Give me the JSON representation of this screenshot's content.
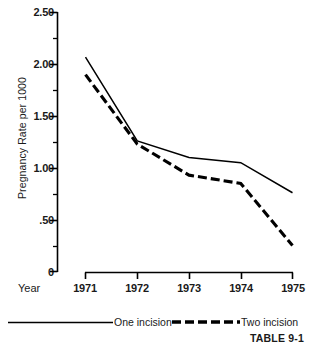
{
  "chart_data": {
    "type": "line",
    "title": "",
    "xlabel": "Year",
    "ylabel": "Pregnancy Rate per 1000",
    "x": [
      1971,
      1972,
      1973,
      1974,
      1975
    ],
    "categories": [
      "1971",
      "1972",
      "1973",
      "1974",
      "1975"
    ],
    "xtick_labels": [
      "1971",
      "1972",
      "1973",
      "1974",
      "1975"
    ],
    "ytick_labels": [
      "2.50",
      "2.00",
      "1.50",
      "1.00",
      ".50",
      "0"
    ],
    "ytick_values": [
      2.5,
      2.0,
      1.5,
      1.0,
      0.5,
      0
    ],
    "yminor_values": [
      2.25,
      1.75,
      1.25,
      0.75,
      0.25
    ],
    "ylim": [
      0,
      2.5
    ],
    "xlim": [
      1971,
      1975
    ],
    "grid": false,
    "legend_position": "bottom",
    "series": [
      {
        "name": "One incision",
        "style": "solid",
        "color": "#000000",
        "values": [
          2.07,
          1.26,
          1.1,
          1.05,
          0.76
        ]
      },
      {
        "name": "Two incision",
        "style": "dashed",
        "color": "#000000",
        "values": [
          1.9,
          1.23,
          0.93,
          0.85,
          0.25
        ]
      }
    ],
    "annotations": [
      "TABLE 9-1"
    ]
  },
  "axes": {
    "y_axis_title": "Pregnancy Rate per 1000",
    "x_axis_title": "Year",
    "y_ticks": [
      {
        "label": "2.50",
        "value": 2.5
      },
      {
        "label": "2.00",
        "value": 2.0
      },
      {
        "label": "1.50",
        "value": 1.5
      },
      {
        "label": "1.00",
        "value": 1.0
      },
      {
        "label": ".50",
        "value": 0.5
      },
      {
        "label": "0",
        "value": 0
      }
    ],
    "x_ticks": [
      {
        "label": "1971"
      },
      {
        "label": "1972"
      },
      {
        "label": "1973"
      },
      {
        "label": "1974"
      },
      {
        "label": "1975"
      }
    ]
  },
  "legend": {
    "entries": [
      {
        "label": "One incision",
        "style": "solid"
      },
      {
        "label": "Two incision",
        "style": "dashed"
      }
    ]
  },
  "footer": {
    "table_tag": "TABLE 9-1"
  },
  "colors": {
    "ink": "#000000",
    "background": "#ffffff"
  }
}
